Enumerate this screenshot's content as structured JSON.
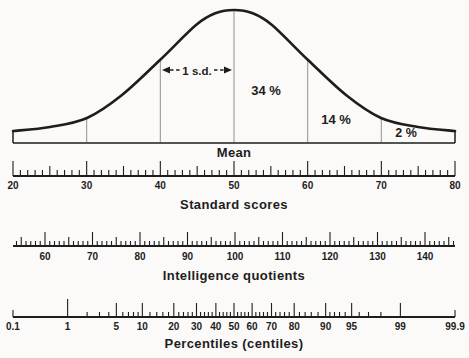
{
  "figure": {
    "background": "#fbfaf8",
    "ink": "#1d1d1d",
    "division_line_color": "#9a9a9a"
  },
  "labels": {
    "mean": "Mean",
    "sd": "1 s.d.",
    "area_mean_to_1sd": "34 %",
    "area_1sd_to_2sd": "14 %",
    "area_beyond_2sd": "2 %"
  },
  "chart_data": {
    "type": "line",
    "curve": {
      "points_px": [
        [
          13,
          131
        ],
        [
          50,
          127
        ],
        [
          87,
          118
        ],
        [
          122,
          95
        ],
        [
          160,
          60
        ],
        [
          196,
          25
        ],
        [
          216,
          13
        ],
        [
          234,
          10
        ],
        [
          252,
          13
        ],
        [
          272,
          25
        ],
        [
          308,
          60
        ],
        [
          346,
          95
        ],
        [
          381,
          118
        ],
        [
          418,
          127
        ],
        [
          455,
          131
        ]
      ],
      "baseline_y": 143,
      "x_left": 13,
      "x_right": 455,
      "end_cap_top_y": 131
    },
    "sd_lines": [
      [
        30,
        118
      ],
      [
        40,
        60
      ],
      [
        50,
        11
      ],
      [
        60,
        60
      ],
      [
        70,
        118
      ]
    ],
    "annotations": {
      "sd_arrow": {
        "from_value": 40,
        "to_value": 50,
        "label": "1 s.d."
      },
      "areas": [
        "34 %",
        "14 %",
        "2 %"
      ],
      "mean_label": "Mean"
    },
    "scales": [
      {
        "id": "standard-scores",
        "title": "Standard scores",
        "line_y": 176,
        "line_x0": 13,
        "line_x1": 455,
        "mapping": {
          "type": "linear",
          "v0": 50,
          "x_at_v0": 234,
          "px_per_unit": 7.3667
        },
        "tick_min": 20,
        "tick_max": 80,
        "tick_step": 1,
        "medium_every": 5,
        "major_every": 10,
        "tick_len": {
          "s": 6,
          "m": 10,
          "l": 15
        },
        "label_y": 189,
        "labels": [
          "20",
          "30",
          "40",
          "50",
          "60",
          "70",
          "80"
        ]
      },
      {
        "id": "intelligence-quotients",
        "title": "Intelligence quotients",
        "line_y": 246,
        "line_x0": 13,
        "line_x1": 455,
        "mapping": {
          "type": "linear",
          "v0": 100,
          "x_at_v0": 235,
          "px_per_unit": 4.75
        },
        "tick_min": 54,
        "tick_max": 146,
        "tick_step": 1,
        "medium_every": 5,
        "major_every": 10,
        "tick_len": {
          "s": 5,
          "m": 9,
          "l": 14
        },
        "label_y": 260,
        "labels": [
          "60",
          "70",
          "80",
          "90",
          "100",
          "110",
          "120",
          "130",
          "140"
        ]
      },
      {
        "id": "percentiles",
        "title": "Percentiles (centiles)",
        "line_y": 317,
        "line_x0": 13,
        "line_x1": 455,
        "mapping": {
          "type": "probit",
          "x_at_50": 234,
          "px_per_z": 71.52
        },
        "tick_len": {
          "s": 5,
          "l": 14,
          "xl": 18,
          "e": 7
        },
        "ticks": [
          [
            "0.1",
            "e"
          ],
          [
            "1",
            "xl"
          ],
          [
            "2",
            "s"
          ],
          [
            "3",
            "s"
          ],
          [
            "4",
            "s"
          ],
          [
            "5",
            "l"
          ],
          [
            "6",
            "s"
          ],
          [
            "7",
            "s"
          ],
          [
            "8",
            "s"
          ],
          [
            "9",
            "s"
          ],
          [
            "10",
            "l"
          ],
          [
            "12",
            "s"
          ],
          [
            "14",
            "s"
          ],
          [
            "16",
            "s"
          ],
          [
            "18",
            "s"
          ],
          [
            "20",
            "l"
          ],
          [
            "22",
            "s"
          ],
          [
            "24",
            "s"
          ],
          [
            "26",
            "s"
          ],
          [
            "28",
            "s"
          ],
          [
            "30",
            "l"
          ],
          [
            "32",
            "s"
          ],
          [
            "34",
            "s"
          ],
          [
            "36",
            "s"
          ],
          [
            "38",
            "s"
          ],
          [
            "40",
            "l"
          ],
          [
            "42",
            "s"
          ],
          [
            "44",
            "s"
          ],
          [
            "46",
            "s"
          ],
          [
            "48",
            "s"
          ],
          [
            "50",
            "l"
          ],
          [
            "52",
            "s"
          ],
          [
            "54",
            "s"
          ],
          [
            "56",
            "s"
          ],
          [
            "58",
            "s"
          ],
          [
            "60",
            "l"
          ],
          [
            "62",
            "s"
          ],
          [
            "64",
            "s"
          ],
          [
            "66",
            "s"
          ],
          [
            "68",
            "s"
          ],
          [
            "70",
            "l"
          ],
          [
            "72",
            "s"
          ],
          [
            "74",
            "s"
          ],
          [
            "76",
            "s"
          ],
          [
            "78",
            "s"
          ],
          [
            "80",
            "l"
          ],
          [
            "82",
            "s"
          ],
          [
            "84",
            "s"
          ],
          [
            "86",
            "s"
          ],
          [
            "88",
            "s"
          ],
          [
            "90",
            "l"
          ],
          [
            "91",
            "s"
          ],
          [
            "92",
            "s"
          ],
          [
            "93",
            "s"
          ],
          [
            "94",
            "s"
          ],
          [
            "95",
            "l"
          ],
          [
            "96",
            "s"
          ],
          [
            "97",
            "s"
          ],
          [
            "98",
            "s"
          ],
          [
            "99",
            "l"
          ],
          [
            "99.9",
            "e"
          ]
        ],
        "label_y": 330,
        "labels": [
          "0.1",
          "1",
          "5",
          "10",
          "20",
          "30",
          "40",
          "50",
          "60",
          "70",
          "80",
          "90",
          "95",
          "99",
          "99.9"
        ]
      }
    ]
  }
}
